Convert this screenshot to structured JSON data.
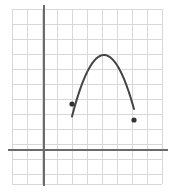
{
  "figure": {
    "background_color": "#ffffff",
    "width": 175,
    "height": 192
  },
  "grid": {
    "name": "coordinate-grid",
    "line_color": "#d8d8d8",
    "line_width": 1,
    "cell_size": 15,
    "left": 12,
    "top": 9,
    "right": 162,
    "bottom": 184,
    "columns": 10,
    "rows": 12,
    "vertical_lines": [
      12,
      27,
      42,
      57,
      72,
      87,
      102,
      117,
      132,
      147,
      162
    ],
    "horizontal_lines": [
      9,
      24,
      39,
      54,
      69,
      84,
      99,
      114,
      129,
      144,
      159,
      174,
      184
    ]
  },
  "axes": {
    "color": "#6b6b6b",
    "line_width": 2,
    "y_axis": {
      "name": "y-axis",
      "x": 44,
      "y_start": 5,
      "y_end": 186
    },
    "x_axis": {
      "name": "x-axis",
      "y": 150,
      "x_start": 8,
      "x_end": 168
    }
  },
  "chart_data": {
    "type": "line",
    "subtitle": "",
    "xlabel": "",
    "ylabel": "",
    "grid": true,
    "legend": "none",
    "curve_color": "#454545",
    "curve_width": 2,
    "endpoint_marker": "filled-circle",
    "endpoint_marker_radius": 2.6,
    "endpoint_marker_color": "#333333",
    "xlim": [
      -2.133,
      7.867
    ],
    "ylim": [
      -2.267,
      9.4
    ],
    "axis_origin_px": [
      44,
      150
    ],
    "pixels_per_unit": 15,
    "series": [
      {
        "name": "parabola-arc",
        "description": "Downward-opening parabola arc with filled endpoints",
        "vertex_px": [
          104,
          55
        ],
        "left_endpoint_px": [
          72,
          104
        ],
        "right_endpoint_px": [
          134,
          120
        ],
        "vertex_units": [
          4.0,
          6.333
        ],
        "left_endpoint_units": [
          1.867,
          3.067
        ],
        "right_endpoint_units": [
          6.0,
          2.0
        ],
        "points_px": [
          [
            72,
            104
          ],
          [
            75,
            96.7
          ],
          [
            78,
            90.0
          ],
          [
            81,
            83.8
          ],
          [
            84,
            78.2
          ],
          [
            87,
            73.1
          ],
          [
            90,
            68.5
          ],
          [
            93,
            64.5
          ],
          [
            96,
            61.1
          ],
          [
            99,
            58.2
          ],
          [
            102,
            55.9
          ],
          [
            104,
            55.0
          ],
          [
            106,
            55.2
          ],
          [
            109,
            56.5
          ],
          [
            112,
            59.0
          ],
          [
            115,
            62.1
          ],
          [
            118,
            65.8
          ],
          [
            121,
            70.1
          ],
          [
            124,
            75.0
          ],
          [
            127,
            80.4
          ],
          [
            130,
            86.5
          ],
          [
            133,
            93.1
          ],
          [
            134,
            120
          ]
        ]
      }
    ]
  }
}
